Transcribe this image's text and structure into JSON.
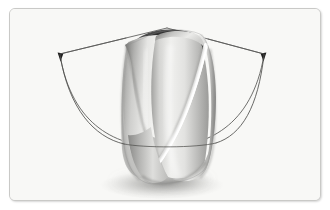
{
  "figure": {
    "title": "Twisted ruled surface with angular sweep indicator",
    "domain": "Diagram",
    "frame": {
      "corner_radius_px": 6,
      "border_color": "#c9c9c7",
      "background_color": "#f8f8f6",
      "shadow": true,
      "width_px": 312,
      "height_px": 193
    },
    "palette": {
      "background": "#f8f8f6",
      "border": "#c9c9c7",
      "surface_light": "#f2f2f0",
      "surface_mid": "#c6c6c4",
      "surface_dark": "#8e8e8c",
      "interior_dark": "#2e2e2e",
      "interior_darkest": "#1a1a1a",
      "slit_white": "#fdfdfc",
      "line_stroke": "#4a4a4a",
      "arrow_fill": "#1e1e1e",
      "shadow_color": "#9a9a98"
    },
    "elements": [
      {
        "name": "twisted-surface",
        "label": "Twisted ruled surface (helicoid band)",
        "description": "Grayscale shaded band twisting about a vertical axis, open at the top revealing a dark spiral interior, split by a white helical slit on the right face."
      },
      {
        "name": "apex-point",
        "label": "Apex vertex",
        "x": 166,
        "y": 26
      },
      {
        "name": "left-ray",
        "label": "Left radial ray",
        "from": {
          "x": 166,
          "y": 26
        },
        "to": {
          "x": 57,
          "y": 52
        }
      },
      {
        "name": "right-ray",
        "label": "Right radial ray",
        "from": {
          "x": 166,
          "y": 26
        },
        "to": {
          "x": 262,
          "y": 52
        }
      },
      {
        "name": "left-arrowhead",
        "label": "Left arrowhead",
        "x": 58,
        "y": 53,
        "direction": "down-left"
      },
      {
        "name": "right-arrowhead",
        "label": "Right arrowhead",
        "x": 261,
        "y": 53,
        "direction": "down-right"
      },
      {
        "name": "sweep-arc",
        "label": "Angular sweep arc",
        "from": {
          "x": 58,
          "y": 55
        },
        "to": {
          "x": 261,
          "y": 55
        },
        "lowest_point": {
          "x": 160,
          "y": 136
        }
      },
      {
        "name": "ground-shadow",
        "label": "Soft cast shadow beneath surface",
        "center_x": 160,
        "center_y": 180
      }
    ]
  }
}
